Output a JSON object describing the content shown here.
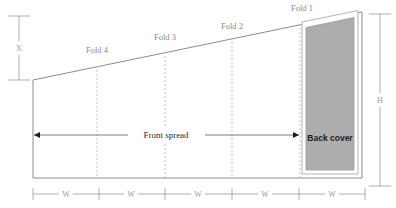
{
  "diagram": {
    "fold_labels": [
      {
        "name": "fold-4",
        "text": "Fold 4",
        "x": 97,
        "label_x": 97,
        "label_y": 53
      },
      {
        "name": "fold-3",
        "text": "Fold 3",
        "x": 165,
        "label_x": 165,
        "label_y": 40
      },
      {
        "name": "fold-2",
        "text": "Fold 2",
        "x": 232,
        "label_x": 232,
        "label_y": 29
      },
      {
        "name": "fold-1",
        "text": "Fold 1",
        "x": 300,
        "label_x": 300,
        "label_y": 11
      }
    ],
    "width_marks": [
      {
        "text": "W",
        "center_x": 66
      },
      {
        "text": "W",
        "center_x": 131
      },
      {
        "text": "W",
        "center_x": 198
      },
      {
        "text": "W",
        "center_x": 265
      },
      {
        "text": "W",
        "center_x": 332
      }
    ],
    "height_dimension": {
      "text": "H",
      "x": 380,
      "y": 100
    },
    "offset_dimension": {
      "text": "X",
      "x": 19,
      "y": 48
    },
    "front_spread": {
      "text": "Front spread",
      "x": 166,
      "y": 135
    },
    "back_cover": {
      "text": "Back cover",
      "x": 332,
      "y": 138
    },
    "colors": {
      "outline": "#8d8d8d",
      "fold": "#c2c2c2",
      "cover_fill": "#adadad",
      "dimension": "#9a9a9a",
      "arrow": "#6e6e6e",
      "label": "#8a8a8a",
      "background": "#ffffff"
    }
  }
}
